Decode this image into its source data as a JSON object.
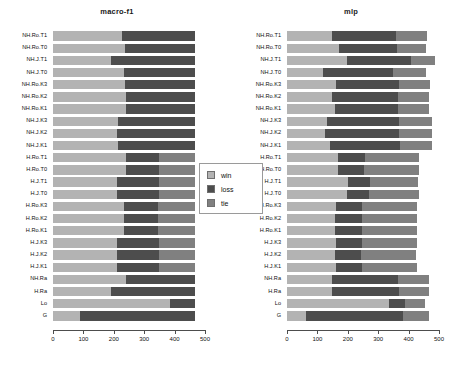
{
  "legend": {
    "items": [
      {
        "label": "win",
        "color": "#b3b3b3"
      },
      {
        "label": "loss",
        "color": "#4d4d4d"
      },
      {
        "label": "tie",
        "color": "#808080"
      }
    ]
  },
  "axis": {
    "ticks": [
      "0",
      "100",
      "200",
      "300",
      "400",
      "500"
    ],
    "min": 0,
    "max": 500
  },
  "chart_data": [
    {
      "type": "bar",
      "title": "macro-f1",
      "orientation": "horizontal",
      "stacked": true,
      "xlabel": "",
      "ylabel": "",
      "xlim": [
        0,
        500
      ],
      "grid": false,
      "legend_position": "center",
      "categories": [
        "NH.Ro.T1",
        "NH.Ro.T0",
        "NH.J.T1",
        "NH.J.T0",
        "NH.Ro.K3",
        "NH.Ro.K2",
        "NH.Ro.K1",
        "NH.J.K3",
        "NH.J.K2",
        "NH.J.K1",
        "H.Ro.T1",
        "H.Ro.T0",
        "H.J.T1",
        "H.J.T0",
        "H.Ro.K3",
        "H.Ro.K2",
        "H.Ro.K1",
        "H.J.K3",
        "H.J.K2",
        "H.J.K1",
        "NH.Ra",
        "H.Ra",
        "Lo",
        "G"
      ],
      "series": [
        {
          "name": "win",
          "values": [
            228,
            238,
            190,
            233,
            237,
            240,
            240,
            214,
            210,
            215,
            240,
            240,
            210,
            210,
            235,
            235,
            235,
            212,
            210,
            212,
            240,
            192,
            385,
            88
          ]
        },
        {
          "name": "loss",
          "values": [
            240,
            230,
            278,
            235,
            231,
            228,
            228,
            254,
            258,
            253,
            108,
            108,
            140,
            138,
            112,
            112,
            112,
            136,
            138,
            136,
            228,
            276,
            83,
            380
          ]
        },
        {
          "name": "tie",
          "values": [
            0,
            0,
            0,
            0,
            0,
            0,
            0,
            0,
            0,
            0,
            120,
            120,
            118,
            120,
            121,
            121,
            121,
            120,
            120,
            120,
            0,
            0,
            0,
            0
          ]
        }
      ]
    },
    {
      "type": "bar",
      "title": "mlp",
      "orientation": "horizontal",
      "stacked": true,
      "xlabel": "",
      "ylabel": "",
      "xlim": [
        0,
        500
      ],
      "grid": false,
      "legend_position": "center",
      "categories": [
        "NH.Ro.T1",
        "NH.Ro.T0",
        "NH.J.T1",
        "NH.J.T0",
        "NH.Ro.K3",
        "NH.Ro.K2",
        "NH.Ro.K1",
        "NH.J.K3",
        "NH.J.K2",
        "NH.J.K1",
        "H.Ro.T1",
        "H.Ro.T0",
        "H.J.T1",
        "H.J.T0",
        "H.Ro.K3",
        "H.Ro.K2",
        "H.Ro.K1",
        "H.J.K3",
        "H.J.K2",
        "H.J.K1",
        "NH.Ra",
        "H.Ra",
        "Lo",
        "G"
      ],
      "series": [
        {
          "name": "win",
          "values": [
            148,
            172,
            196,
            118,
            162,
            148,
            158,
            130,
            125,
            140,
            168,
            168,
            202,
            196,
            160,
            158,
            158,
            160,
            158,
            160,
            148,
            148,
            335,
            62
          ]
        },
        {
          "name": "loss",
          "values": [
            212,
            190,
            212,
            230,
            208,
            218,
            208,
            240,
            242,
            232,
            88,
            84,
            70,
            74,
            88,
            88,
            88,
            86,
            86,
            86,
            218,
            220,
            52,
            320
          ]
        },
        {
          "name": "tie",
          "values": [
            100,
            95,
            80,
            110,
            102,
            100,
            100,
            108,
            110,
            105,
            178,
            182,
            160,
            164,
            180,
            180,
            180,
            180,
            180,
            180,
            100,
            100,
            68,
            85
          ]
        }
      ]
    }
  ]
}
